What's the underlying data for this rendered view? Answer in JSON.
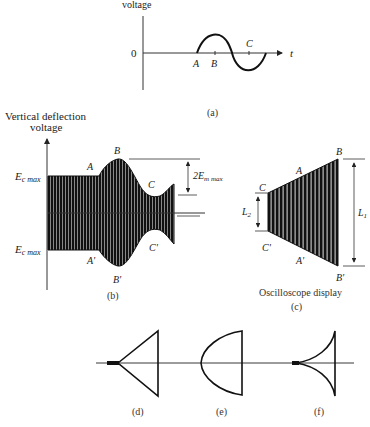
{
  "figure": {
    "panel_a": {
      "y_axis_label": "voltage",
      "zero_label": "0",
      "t_label": "t",
      "points": [
        "A",
        "B",
        "C"
      ],
      "caption": "(a)"
    },
    "panel_b": {
      "y_axis_label_line1": "Vertical deflection",
      "y_axis_label_line2": "voltage",
      "ec_max_top": "E",
      "ec_max_top_sub": "c max",
      "ec_max_bottom": "E",
      "ec_max_bottom_sub": "c max",
      "em_label": "2E",
      "em_sub": "m max",
      "upper_points": [
        "A",
        "B",
        "C"
      ],
      "lower_points": [
        "A'",
        "B'",
        "C'"
      ],
      "caption": "(b)"
    },
    "panel_c": {
      "upper_points": [
        "C",
        "A",
        "B"
      ],
      "lower_points": [
        "C'",
        "A'",
        "B'"
      ],
      "l2_label": "L",
      "l2_sub": "2",
      "l1_label": "L",
      "l1_sub": "1",
      "title": "Oscilloscope display",
      "caption": "(c)"
    },
    "panel_d": {
      "caption": "(d)"
    },
    "panel_e": {
      "caption": "(e)"
    },
    "panel_f": {
      "caption": "(f)"
    }
  }
}
